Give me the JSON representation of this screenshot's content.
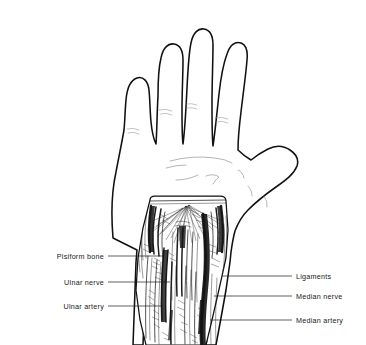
{
  "figure": {
    "view": "palmar",
    "background_color": "#ffffff",
    "line_color": "#111111",
    "label_color": "#1a1a1a"
  },
  "labels": {
    "left": [
      {
        "id": "pisiform-bone",
        "text": "Pisiform bone",
        "text_x": 104,
        "text_y": 259,
        "leader_x1": 108,
        "leader_x2": 163,
        "leader_y": 256
      },
      {
        "id": "ulnar-nerve",
        "text": "Ulnar nerve",
        "text_x": 104,
        "text_y": 285,
        "leader_x1": 108,
        "leader_x2": 170,
        "leader_y": 282
      },
      {
        "id": "ulnar-artery",
        "text": "Ulnar artery",
        "text_x": 104,
        "text_y": 309,
        "leader_x1": 108,
        "leader_x2": 163,
        "leader_y": 306
      }
    ],
    "right": [
      {
        "id": "ligaments",
        "text": "Ligaments",
        "text_x": 296,
        "text_y": 279,
        "leader_x1": 222,
        "leader_x2": 292,
        "leader_y": 276
      },
      {
        "id": "median-nerve",
        "text": "Median nerve",
        "text_x": 296,
        "text_y": 299,
        "leader_x1": 214,
        "leader_x2": 292,
        "leader_y": 296
      },
      {
        "id": "median-artery",
        "text": "Median artery",
        "text_x": 296,
        "text_y": 323,
        "leader_x1": 210,
        "leader_x2": 292,
        "leader_y": 320
      }
    ]
  },
  "structures": {
    "fingers": [
      "little-finger",
      "ring-finger",
      "middle-finger",
      "index-finger"
    ],
    "thumb": "thumb",
    "palm": "palm",
    "dissection_window": "wrist-dissection-window",
    "forearm": "distal-forearm"
  }
}
